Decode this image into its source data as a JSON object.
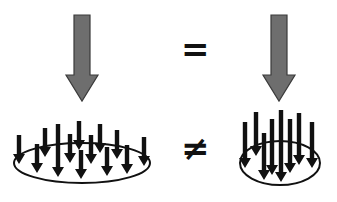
{
  "symbols": {
    "equals": "=",
    "not_equals": "≠"
  },
  "colors": {
    "big_arrow_fill": "#6e6e6e",
    "big_arrow_stroke": "#3a3a3a",
    "small_arrow": "#111111",
    "ellipse": "#111111"
  },
  "diagram": {
    "top_left": {
      "type": "large-arrow",
      "x": 82,
      "y_top": 15,
      "y_tip": 101
    },
    "top_right": {
      "type": "large-arrow",
      "x": 279,
      "y_top": 15,
      "y_tip": 101
    },
    "bottom_left": {
      "type": "distributed-load",
      "ellipse": {
        "cx": 82,
        "cy": 163,
        "rx": 68,
        "ry": 20
      },
      "arrows": [
        {
          "x": 19,
          "y1": 135,
          "y2": 164
        },
        {
          "x": 37,
          "y1": 144,
          "y2": 173
        },
        {
          "x": 45,
          "y1": 128,
          "y2": 157
        },
        {
          "x": 58,
          "y1": 124,
          "y2": 177
        },
        {
          "x": 70,
          "y1": 134,
          "y2": 163
        },
        {
          "x": 79,
          "y1": 121,
          "y2": 150
        },
        {
          "x": 81,
          "y1": 150,
          "y2": 179
        },
        {
          "x": 91,
          "y1": 135,
          "y2": 164
        },
        {
          "x": 100,
          "y1": 124,
          "y2": 153
        },
        {
          "x": 107,
          "y1": 147,
          "y2": 176
        },
        {
          "x": 117,
          "y1": 130,
          "y2": 159
        },
        {
          "x": 127,
          "y1": 145,
          "y2": 174
        },
        {
          "x": 144,
          "y1": 137,
          "y2": 166
        }
      ]
    },
    "bottom_right": {
      "type": "concentrated-load",
      "ellipse": {
        "cx": 280,
        "cy": 163,
        "rx": 40,
        "ry": 22
      },
      "arrows": [
        {
          "x": 245,
          "y1": 122,
          "y2": 168
        },
        {
          "x": 256,
          "y1": 112,
          "y2": 156
        },
        {
          "x": 264,
          "y1": 133,
          "y2": 180
        },
        {
          "x": 272,
          "y1": 119,
          "y2": 175
        },
        {
          "x": 281,
          "y1": 110,
          "y2": 182
        },
        {
          "x": 290,
          "y1": 119,
          "y2": 173
        },
        {
          "x": 299,
          "y1": 113,
          "y2": 165
        },
        {
          "x": 312,
          "y1": 122,
          "y2": 168
        }
      ]
    }
  }
}
